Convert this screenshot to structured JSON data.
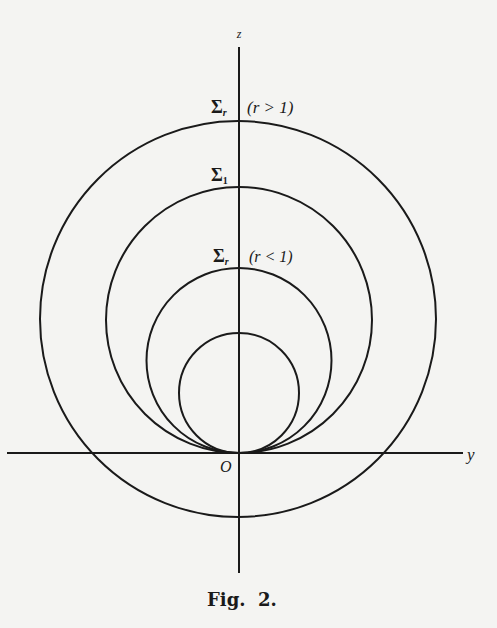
{
  "figure": {
    "caption": "Fig.  2.",
    "axes": {
      "vertical_label": "z",
      "horizontal_label": "y",
      "origin_label": "O"
    },
    "curves": [
      {
        "id": "outer",
        "label": "Σ",
        "subscript": "r",
        "condition": "(r > 1)"
      },
      {
        "id": "unit",
        "label": "Σ",
        "subscript": "1",
        "condition": ""
      },
      {
        "id": "inner",
        "label": "Σ",
        "subscript": "r",
        "condition": "(r < 1)"
      },
      {
        "id": "smallest",
        "label": "",
        "subscript": "",
        "condition": ""
      }
    ],
    "colors": {
      "ink": "#1a1a1a",
      "paper": "#f4f4f2"
    }
  }
}
